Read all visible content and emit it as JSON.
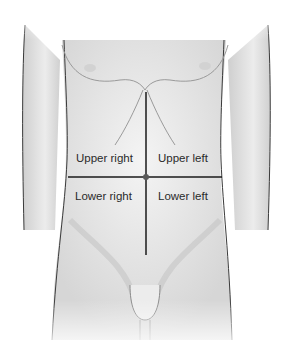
{
  "figure": {
    "quadrants": [
      {
        "id": "upper-right",
        "label": "Upper right"
      },
      {
        "id": "upper-left",
        "label": "Upper left"
      },
      {
        "id": "lower-right",
        "label": "Lower right"
      },
      {
        "id": "lower-left",
        "label": "Lower left"
      }
    ],
    "center_marker": "umbilicus",
    "colors": {
      "skin": "#e6e6e6",
      "shadow": "#b8b8b8",
      "outline": "#3a3a3a",
      "divider": "#1a1a1a",
      "text": "#2a2a2a"
    }
  }
}
